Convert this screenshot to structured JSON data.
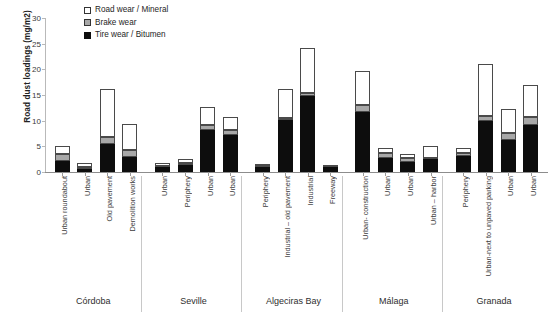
{
  "axis": {
    "ylabel": "Road dust loadings (mg/m2)",
    "yticks": [
      "0",
      "5",
      "10",
      "15",
      "20",
      "25",
      "30"
    ],
    "ymin": 0,
    "ymax": 30
  },
  "legend": {
    "items": [
      {
        "label": "Road wear / Mineral",
        "swatch": "road"
      },
      {
        "label": "Brake wear",
        "swatch": "brake"
      },
      {
        "label": "Tire wear / Bitumen",
        "swatch": "tire"
      }
    ]
  },
  "groups": [
    {
      "name": "Córdoba"
    },
    {
      "name": "Seville"
    },
    {
      "name": "Algeciras Bay"
    },
    {
      "name": "Málaga"
    },
    {
      "name": "Granada"
    }
  ],
  "chart_data": {
    "type": "bar",
    "title": "",
    "xlabel": "",
    "ylabel": "Road dust loadings (mg/m2)",
    "ylim": [
      0,
      30
    ],
    "grid": false,
    "stacked": true,
    "legend_position": "top-left",
    "categories": [
      "Urban roundabout",
      "Urban",
      "Old pavement",
      "Demolition works",
      "Urban",
      "Periphery",
      "Urban",
      "Urban",
      "Periphery",
      "Industrial – old pavement",
      "Industrial",
      "Freeway",
      "Urban- construction",
      "Urban",
      "Urban",
      "Urban – harbor",
      "Periphery",
      "Urban-next to unpaved parking",
      "Urban",
      "Urban"
    ],
    "group_of_category": [
      "Córdoba",
      "Córdoba",
      "Córdoba",
      "Córdoba",
      "Seville",
      "Seville",
      "Seville",
      "Seville",
      "Algeciras Bay",
      "Algeciras Bay",
      "Algeciras Bay",
      "Algeciras Bay",
      "Málaga",
      "Málaga",
      "Málaga",
      "Málaga",
      "Granada",
      "Granada",
      "Granada",
      "Granada"
    ],
    "series": [
      {
        "name": "Tire wear / Bitumen",
        "color": "#0d0d0d",
        "values": [
          2.1,
          0.6,
          5.4,
          2.9,
          0.9,
          1.4,
          8.1,
          7.2,
          0.9,
          10.2,
          14.9,
          0.9,
          11.6,
          2.8,
          1.9,
          2.5,
          3.2,
          10.0,
          6.3,
          9.2
        ]
      },
      {
        "name": "Brake wear",
        "color": "#a8a8a8",
        "values": [
          1.5,
          0.4,
          1.5,
          1.4,
          0.3,
          0.3,
          1.1,
          1.0,
          0.2,
          0.4,
          0.4,
          0.1,
          1.5,
          0.9,
          0.8,
          0.3,
          0.5,
          0.9,
          1.3,
          1.5
        ]
      },
      {
        "name": "Road wear / Mineral",
        "color": "#ffffff",
        "values": [
          1.4,
          0.7,
          9.3,
          5.1,
          0.6,
          0.9,
          3.4,
          2.6,
          0.5,
          5.6,
          8.9,
          0.2,
          6.6,
          1.0,
          0.9,
          2.2,
          1.0,
          10.1,
          4.6,
          6.2
        ]
      }
    ],
    "totals": [
      5.0,
      1.7,
      16.2,
      9.4,
      1.8,
      2.6,
      12.6,
      10.8,
      1.6,
      16.2,
      24.2,
      1.2,
      19.7,
      4.7,
      3.6,
      5.0,
      4.7,
      21.0,
      12.2,
      16.9
    ]
  }
}
